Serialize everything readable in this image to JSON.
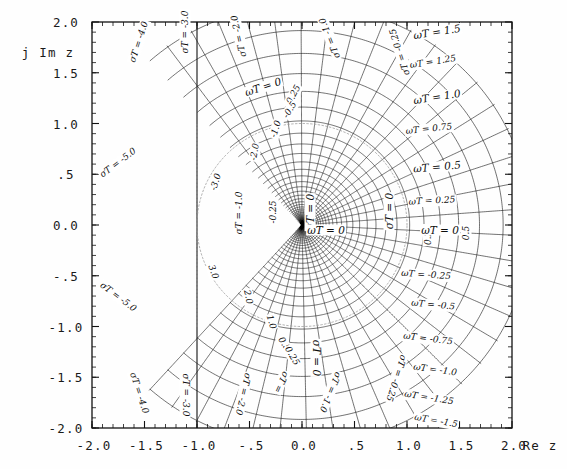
{
  "chart_data": {
    "type": "line",
    "title": "",
    "xlabel": "Re z",
    "ylabel": "j Im z",
    "xlim": [
      -2.0,
      2.0
    ],
    "ylim": [
      -2.0,
      2.0
    ],
    "grid": false,
    "legend": "none",
    "xticklabels": [
      "-2.0",
      "-1.5",
      "-1.0",
      "-.5",
      "0.0",
      ".5",
      "1.0",
      "1.5",
      "2.0"
    ],
    "xtickvalues": [
      -2.0,
      -1.5,
      -1.0,
      -0.5,
      0.0,
      0.5,
      1.0,
      1.5,
      2.0
    ],
    "yticklabels": [
      "2.0",
      "1.5",
      "1.0",
      ".5",
      "0.0",
      "-.5",
      "-1.0",
      "-1.5",
      "-2.0"
    ],
    "ytickvalues": [
      2.0,
      1.5,
      1.0,
      0.5,
      0.0,
      -0.5,
      -1.0,
      -1.5,
      -2.0
    ],
    "minor_ticks_per_interval": 5,
    "series": [
      {
        "name": "constant sigma*T loci",
        "values": [
          -5.0,
          -4.0,
          -3.0,
          -2.0,
          -1.0,
          -0.5,
          -0.25,
          0.0,
          0.25,
          0.5
        ]
      },
      {
        "name": "constant omega*T loci",
        "values": [
          -2.0,
          -1.5,
          -1.25,
          -1.0,
          -0.75,
          -0.5,
          -0.25,
          0.0,
          0.25,
          0.5,
          0.75,
          1.0,
          1.25,
          1.5,
          2.0
        ]
      }
    ],
    "unit_circle": {
      "radius": 1.0,
      "center": [
        0,
        0
      ],
      "style": "dotted"
    }
  },
  "axes": {
    "y_axis_title": "j Im z",
    "x_axis_title": "Re z",
    "y_labels": [
      {
        "text": "2.0",
        "value": 2.0
      },
      {
        "text": "1.5",
        "value": 1.5
      },
      {
        "text": "1.0",
        "value": 1.0
      },
      {
        "text": ".5",
        "value": 0.5
      },
      {
        "text": "0.0",
        "value": 0.0
      },
      {
        "text": "-.5",
        "value": -0.5
      },
      {
        "text": "-1.0",
        "value": -1.0
      },
      {
        "text": "-1.5",
        "value": -1.5
      },
      {
        "text": "-2.0",
        "value": -2.0
      }
    ],
    "x_labels": [
      {
        "text": "-2.0",
        "value": -2.0
      },
      {
        "text": "-1.5",
        "value": -1.5
      },
      {
        "text": "-1.0",
        "value": -1.0
      },
      {
        "text": "-.5",
        "value": -0.5
      },
      {
        "text": "0.0",
        "value": 0.0
      },
      {
        "text": ".5",
        "value": 0.5
      },
      {
        "text": "1.0",
        "value": 1.0
      },
      {
        "text": "1.5",
        "value": 1.5
      },
      {
        "text": "2.0",
        "value": 2.0
      }
    ]
  },
  "annotations": {
    "sigma_labels": [
      {
        "id": "sigmaT-m5.0-upper",
        "text": "σT = -5.0",
        "x": 118,
        "y": 163,
        "rot": -37
      },
      {
        "id": "sigmaT-m4.0-upper",
        "text": "σT = -4.0",
        "x": 139,
        "y": 42,
        "rot": -72
      },
      {
        "id": "sigmaT-m3.0-upper",
        "text": "σT = -3.0",
        "x": 185,
        "y": 32,
        "rot": -90
      },
      {
        "id": "sigmaT-m2.0-upper",
        "text": "σT = -2.0",
        "x": 239,
        "y": 36,
        "rot": -103
      },
      {
        "id": "sigmaT-m1.0-upper",
        "text": "σT = -1.0",
        "x": 330,
        "y": 38,
        "rot": -112
      },
      {
        "id": "sigmaT-m0.25-upper",
        "text": "σT = -0.25",
        "x": 400,
        "y": 52,
        "rot": -108
      },
      {
        "id": "sigmaT-m0.25-small-a",
        "text": "-0.25",
        "x": 293,
        "y": 96,
        "rot": -62
      },
      {
        "id": "sigmaT-m0.5-small",
        "text": "-0.5",
        "x": 290,
        "y": 110,
        "rot": -58
      },
      {
        "id": "sigmaT-m1.0-small",
        "text": "-1.0",
        "x": 276,
        "y": 129,
        "rot": -72
      },
      {
        "id": "sigmaT-m2.0-small",
        "text": "-2.0",
        "x": 255,
        "y": 152,
        "rot": -80
      },
      {
        "id": "sigmaT-m3.0-small",
        "text": "-3.0",
        "x": 216,
        "y": 182,
        "rot": -72
      },
      {
        "id": "sigmaT-m1.0-mid",
        "text": "σT = -1.0",
        "x": 239,
        "y": 213,
        "rot": -90
      },
      {
        "id": "sigmaT-m0.25-mid",
        "text": "-0.25",
        "x": 273,
        "y": 212,
        "rot": -90
      },
      {
        "id": "sigmaT-0-mid",
        "text": "σT = 0",
        "x": 310,
        "y": 212,
        "rot": -90
      },
      {
        "id": "sigmaT-0-right",
        "text": "σT = 0",
        "x": 389,
        "y": 211,
        "rot": -90
      },
      {
        "id": "sigmaT-0.25-right",
        "text": "0.25",
        "x": 428,
        "y": 235,
        "rot": -90
      },
      {
        "id": "sigmaT-0.5-right",
        "text": "0.5",
        "x": 466,
        "y": 233,
        "rot": -90
      },
      {
        "id": "sigmaT-3.0-small-lo",
        "text": "3.0",
        "x": 213,
        "y": 272,
        "rot": 70
      },
      {
        "id": "sigmaT-2.0-small-lo",
        "text": "2.0",
        "x": 248,
        "y": 297,
        "rot": 78
      },
      {
        "id": "sigmaT-1.0-small-lo",
        "text": "1.0",
        "x": 271,
        "y": 322,
        "rot": 72
      },
      {
        "id": "sigmaT-0.5-small-lo",
        "text": "0.5",
        "x": 284,
        "y": 344,
        "rot": 58
      },
      {
        "id": "sigmaT-0.25-small-lo",
        "text": "0.25",
        "x": 292,
        "y": 356,
        "rot": 60
      },
      {
        "id": "sigmaT-0-lo",
        "text": "σT = 0",
        "x": 316,
        "y": 358,
        "rot": 90
      },
      {
        "id": "sigmaT-m1.0-lower",
        "text": "σT = -1.0",
        "x": 330,
        "y": 392,
        "rot": 112
      },
      {
        "id": "sigmaT-m0.25-lower",
        "text": "σT = -0.25",
        "x": 396,
        "y": 378,
        "rot": 108
      },
      {
        "id": "sigmaT-m5.0-lower",
        "text": "σT = -5.0",
        "x": 118,
        "y": 297,
        "rot": 37
      },
      {
        "id": "sigmaT-m4.0-lower",
        "text": "σT = -4.0",
        "x": 139,
        "y": 393,
        "rot": 72
      },
      {
        "id": "sigmaT-m3.0-lower",
        "text": "σT = -3.0",
        "x": 185,
        "y": 395,
        "rot": 90
      },
      {
        "id": "sigmaT-m2.0-lower",
        "text": "σT = -2.0",
        "x": 243,
        "y": 394,
        "rot": 103
      },
      {
        "id": "sigmaT-m2.0-lower2",
        "text": "σT =",
        "x": 281,
        "y": 382,
        "rot": 115
      }
    ],
    "omega_labels": [
      {
        "id": "omegaT-1.5",
        "text": "ωT = 1.5",
        "x": 437,
        "y": 32,
        "rot": -9
      },
      {
        "id": "omegaT-1.25",
        "text": "ωT = 1.25",
        "x": 433,
        "y": 62,
        "rot": -9
      },
      {
        "id": "omegaT-1.0",
        "text": "ωT = 1.0",
        "x": 437,
        "y": 97,
        "rot": -9
      },
      {
        "id": "omegaT-0.75",
        "text": "ωT = 0.75",
        "x": 429,
        "y": 129,
        "rot": -6
      },
      {
        "id": "omegaT-0.5",
        "text": "ωT = 0.5",
        "x": 437,
        "y": 167,
        "rot": -5
      },
      {
        "id": "omegaT-0.25",
        "text": "ωT = 0.25",
        "x": 432,
        "y": 201,
        "rot": -3
      },
      {
        "id": "omegaT-0-right",
        "text": "ωT = 0",
        "x": 440,
        "y": 230,
        "rot": 0
      },
      {
        "id": "omegaT-0-mid",
        "text": "ωT = 0",
        "x": 326,
        "y": 230,
        "rot": 0
      },
      {
        "id": "omegaT-0-top",
        "text": "ωT = 0",
        "x": 263,
        "y": 87,
        "rot": -18
      },
      {
        "id": "omegaT-m0.25",
        "text": "ωT = -0.25",
        "x": 426,
        "y": 275,
        "rot": 4
      },
      {
        "id": "omegaT-m0.5",
        "text": "ωT = -0.5",
        "x": 433,
        "y": 305,
        "rot": 5
      },
      {
        "id": "omegaT-m0.75",
        "text": "ωT = -0.75",
        "x": 428,
        "y": 339,
        "rot": 7
      },
      {
        "id": "omegaT-m1.0",
        "text": "ωT = -1.0",
        "x": 435,
        "y": 370,
        "rot": 8
      },
      {
        "id": "omegaT-m1.25",
        "text": "ωT = -1.25",
        "x": 429,
        "y": 398,
        "rot": 9
      },
      {
        "id": "omegaT-m1.5",
        "text": "ωT = -1.5",
        "x": 436,
        "y": 421,
        "rot": 10
      }
    ]
  },
  "style": {
    "ink": "#121212",
    "paper": "#ffffff",
    "dotted": "#9a9a9a"
  },
  "frame": {
    "left": 92,
    "top": 22,
    "right": 512,
    "bottom": 428
  }
}
